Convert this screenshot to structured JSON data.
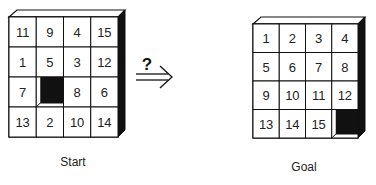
{
  "start": {
    "label": "Start",
    "grid": [
      [
        "11",
        "9",
        "4",
        "15"
      ],
      [
        "1",
        "5",
        "3",
        "12"
      ],
      [
        "7",
        "",
        "8",
        "6"
      ],
      [
        "13",
        "2",
        "10",
        "14"
      ]
    ],
    "empty": [
      2,
      1
    ]
  },
  "goal": {
    "label": "Goal",
    "grid": [
      [
        "1",
        "2",
        "3",
        "4"
      ],
      [
        "5",
        "6",
        "7",
        "8"
      ],
      [
        "9",
        "10",
        "11",
        "12"
      ],
      [
        "13",
        "14",
        "15",
        ""
      ]
    ],
    "empty": [
      3,
      3
    ]
  },
  "transition": {
    "symbol": "?",
    "arrow": "double-right-arrow"
  },
  "colors": {
    "line": "#111111",
    "hole": "#111111",
    "tile": "#ffffff"
  }
}
